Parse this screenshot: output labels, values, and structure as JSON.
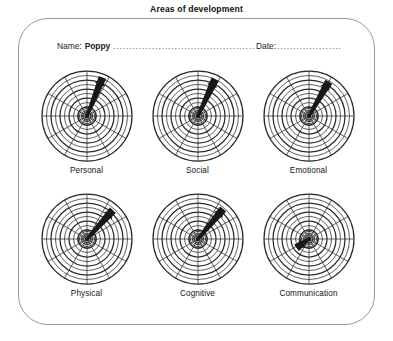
{
  "document": {
    "title": "Areas of development"
  },
  "form": {
    "name_label": "Name:",
    "name_value": "Poppy",
    "date_label": "Date:",
    "date_value": "",
    "leader_dots": "......................................................................................................",
    "date_leader_dots": ".............................................."
  },
  "style": {
    "grid_color": "#2b2b2b",
    "needle_color": "#181818",
    "border_color": "#9a9a9a",
    "text_color": "#141414"
  },
  "chart_data": {
    "type": "radar",
    "title": "Areas of development",
    "rings": 10,
    "spokes": 12,
    "grid": true,
    "legend": "none",
    "rlim": [
      0,
      10
    ],
    "categories": [
      "Personal",
      "Social",
      "Emotional",
      "Physical",
      "Cognitive",
      "Communication"
    ],
    "series": [
      {
        "name": "Rating needle",
        "values": [
          9.0,
          8.8,
          8.6,
          8.2,
          8.4,
          3.2
        ]
      }
    ],
    "dials": [
      {
        "label": "Personal",
        "needle_angle_deg": 68,
        "needle_length_pct": 92,
        "value": 9.0
      },
      {
        "label": "Social",
        "needle_angle_deg": 65,
        "needle_length_pct": 90,
        "value": 8.8
      },
      {
        "label": "Emotional",
        "needle_angle_deg": 60,
        "needle_length_pct": 88,
        "value": 8.6
      },
      {
        "label": "Physical",
        "needle_angle_deg": 48,
        "needle_length_pct": 86,
        "value": 8.2
      },
      {
        "label": "Cognitive",
        "needle_angle_deg": 50,
        "needle_length_pct": 87,
        "value": 8.4
      },
      {
        "label": "Communication",
        "needle_angle_deg": 215,
        "needle_length_pct": 34,
        "value": 3.2
      }
    ]
  }
}
